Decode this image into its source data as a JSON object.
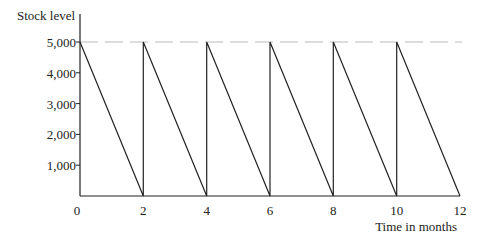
{
  "chart_data": {
    "type": "line",
    "title": "",
    "xlabel": "Time in months",
    "ylabel": "Stock level",
    "x_ticks": [
      "0",
      "2",
      "4",
      "6",
      "8",
      "10",
      "12"
    ],
    "y_ticks": [
      "1,000",
      "2,000",
      "3,000",
      "4,000",
      "5,000"
    ],
    "xlim": [
      0,
      12
    ],
    "ylim": [
      0,
      5000
    ],
    "grid": false,
    "reference_line": {
      "y": 5000,
      "style": "dashed"
    },
    "series": [
      {
        "name": "Stock level",
        "points": [
          [
            0,
            5000
          ],
          [
            2,
            0
          ],
          [
            2,
            5000
          ],
          [
            4,
            0
          ],
          [
            4,
            5000
          ],
          [
            6,
            0
          ],
          [
            6,
            5000
          ],
          [
            8,
            0
          ],
          [
            8,
            5000
          ],
          [
            10,
            0
          ],
          [
            10,
            5000
          ],
          [
            12,
            0
          ]
        ]
      }
    ]
  },
  "colors": {
    "axis": "#222222",
    "line": "#222222",
    "dashed": "#bbbbbb"
  }
}
